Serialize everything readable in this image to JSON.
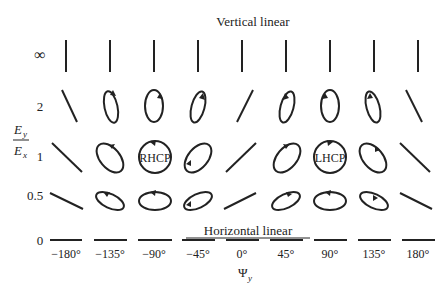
{
  "diagram": {
    "title_top": "Vertical linear",
    "title_bottom": "Horizontal linear",
    "y_axis": {
      "label_num": "E",
      "label_num_sub": "y",
      "label_den": "E",
      "label_den_sub": "x",
      "ticks": [
        "∞",
        "2",
        "1",
        "0.5",
        "0"
      ]
    },
    "x_axis": {
      "label": "Ψ",
      "label_sub": "y",
      "ticks": [
        "−180°",
        "−135°",
        "−90°",
        "−45°",
        "0°",
        "45°",
        "90°",
        "135°",
        "180°"
      ]
    },
    "annotations": {
      "rhcp": "RHCP",
      "lhcp": "LHCP"
    }
  }
}
